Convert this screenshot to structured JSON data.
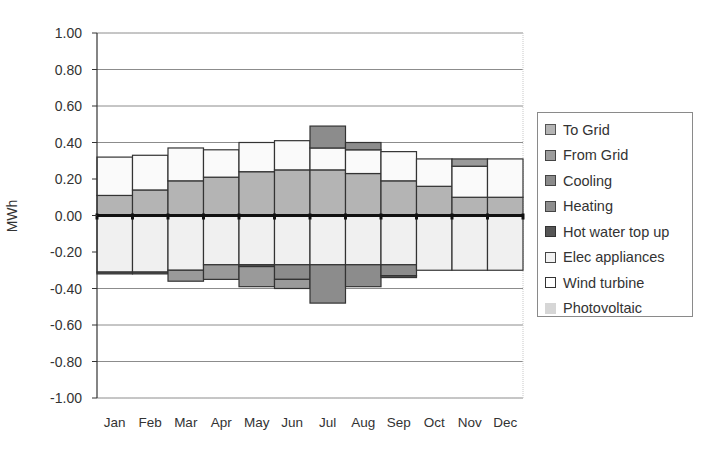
{
  "chart_data": {
    "type": "bar",
    "stacked": true,
    "title": "",
    "xlabel": "",
    "ylabel": "MWh",
    "ylim": [
      -1.0,
      1.0
    ],
    "yticks": [
      "1.00",
      "0.80",
      "0.60",
      "0.40",
      "0.20",
      "0.00",
      "-0.20",
      "-0.40",
      "-0.60",
      "-0.80",
      "-1.00"
    ],
    "ytick_values": [
      1.0,
      0.8,
      0.6,
      0.4,
      0.2,
      0.0,
      -0.2,
      -0.4,
      -0.6,
      -0.8,
      -1.0
    ],
    "grid": true,
    "legend_position": "right",
    "categories": [
      "Jan",
      "Feb",
      "Mar",
      "Apr",
      "May",
      "Jun",
      "Jul",
      "Aug",
      "Sep",
      "Oct",
      "Nov",
      "Dec"
    ],
    "series": [
      {
        "name": "To Grid",
        "color": "#b4b4b4",
        "values": [
          0.11,
          0.14,
          0.19,
          0.21,
          0.24,
          0.25,
          0.25,
          0.23,
          0.19,
          0.16,
          0.1,
          0.1
        ]
      },
      {
        "name": "From Grid",
        "color": "#9c9c9c",
        "values": [
          0,
          0,
          0,
          0,
          0,
          0,
          0,
          0,
          0,
          0,
          0,
          0
        ]
      },
      {
        "name": "Cooling",
        "color": "#8c8c8c",
        "values": [
          0,
          0,
          0,
          0,
          0,
          -0.08,
          -0.21,
          -0.12,
          -0.06,
          0,
          0,
          0
        ],
        "positive_values": [
          0,
          0,
          0,
          0,
          0,
          0,
          0.12,
          0.04,
          0,
          0,
          0,
          0
        ]
      },
      {
        "name": "Heating",
        "color": "#9a9a9a",
        "values": [
          0,
          0,
          -0.06,
          -0.08,
          -0.12,
          -0.05,
          0,
          0,
          0,
          0,
          0,
          0
        ],
        "positive_values": [
          0,
          0,
          0,
          0,
          0,
          0,
          0,
          0,
          0,
          0,
          0.04,
          0
        ]
      },
      {
        "name": "Hot water top up",
        "color": "#555555",
        "values": [
          -0.01,
          -0.01,
          0,
          0,
          -0.01,
          0,
          0,
          0,
          -0.01,
          0,
          0,
          0
        ]
      },
      {
        "name": "Elec appliances",
        "color": "#f0f0f0",
        "values": [
          -0.31,
          -0.31,
          -0.3,
          -0.27,
          -0.27,
          -0.27,
          -0.27,
          -0.27,
          -0.27,
          -0.3,
          -0.3,
          -0.3
        ]
      },
      {
        "name": "Wind turbine",
        "color": "#fafafa",
        "values": [
          0.21,
          0.19,
          0.18,
          0.15,
          0.16,
          0.16,
          0.12,
          0.13,
          0.16,
          0.15,
          0.17,
          0.21
        ]
      },
      {
        "name": "Photovoltaic",
        "color": "#d6d6d6",
        "values": [
          0,
          0,
          0,
          0,
          0,
          0,
          0,
          0,
          0,
          0,
          0,
          0
        ]
      }
    ],
    "stack_layers": {
      "positive": [
        {
          "series": "To Grid",
          "tops": [
            0.11,
            0.14,
            0.19,
            0.21,
            0.24,
            0.25,
            0.25,
            0.23,
            0.19,
            0.16,
            0.1,
            0.1
          ]
        },
        {
          "series": "Wind turbine",
          "tops": [
            0.32,
            0.33,
            0.37,
            0.36,
            0.4,
            0.41,
            0.37,
            0.36,
            0.35,
            0.31,
            0.27,
            0.31
          ]
        },
        {
          "series": "Cooling",
          "tops": [
            0.32,
            0.33,
            0.37,
            0.36,
            0.4,
            0.41,
            0.49,
            0.4,
            0.35,
            0.31,
            0.27,
            0.31
          ]
        },
        {
          "series": "Heating",
          "tops": [
            0.32,
            0.33,
            0.37,
            0.36,
            0.4,
            0.41,
            0.49,
            0.4,
            0.35,
            0.31,
            0.31,
            0.31
          ]
        }
      ],
      "negative": [
        {
          "series": "Elec appliances",
          "bottoms": [
            -0.31,
            -0.31,
            -0.3,
            -0.27,
            -0.27,
            -0.27,
            -0.27,
            -0.27,
            -0.27,
            -0.3,
            -0.3,
            -0.3
          ]
        },
        {
          "series": "Hot water top up",
          "bottoms": [
            -0.32,
            -0.32,
            -0.3,
            -0.27,
            -0.28,
            -0.27,
            -0.27,
            -0.27,
            -0.27,
            -0.3,
            -0.3,
            -0.3
          ]
        },
        {
          "series": "Cooling",
          "bottoms": [
            -0.32,
            -0.32,
            -0.3,
            -0.27,
            -0.28,
            -0.35,
            -0.48,
            -0.39,
            -0.33,
            -0.3,
            -0.3,
            -0.3
          ]
        },
        {
          "series": "Heating",
          "bottoms": [
            -0.32,
            -0.32,
            -0.36,
            -0.35,
            -0.39,
            -0.4,
            -0.48,
            -0.39,
            -0.33,
            -0.3,
            -0.3,
            -0.3
          ]
        },
        {
          "series": "Hot water top up",
          "bottoms": [
            -0.32,
            -0.32,
            -0.36,
            -0.35,
            -0.39,
            -0.4,
            -0.48,
            -0.39,
            -0.34,
            -0.3,
            -0.3,
            -0.3
          ]
        }
      ]
    }
  },
  "legend": {
    "items": [
      {
        "label": "To Grid",
        "color": "#b4b4b4",
        "border": "#555"
      },
      {
        "label": "From Grid",
        "color": "#9c9c9c",
        "border": "#444"
      },
      {
        "label": "Cooling",
        "color": "#8a8a8a",
        "border": "#444"
      },
      {
        "label": "Heating",
        "color": "#8e8e8e",
        "border": "#444"
      },
      {
        "label": "Hot water top up",
        "color": "#555555",
        "border": "#333"
      },
      {
        "label": "Elec appliances",
        "color": "#f2f2f2",
        "border": "#444"
      },
      {
        "label": "Wind turbine",
        "color": "#ffffff",
        "border": "#333"
      },
      {
        "label": "Photovoltaic",
        "color": "#d6d6d6",
        "border": "transparent"
      }
    ]
  },
  "axis": {
    "ylabel": "MWh"
  }
}
